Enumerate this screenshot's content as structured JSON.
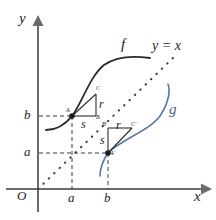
{
  "figure": {
    "kind": "math-diagram",
    "colors": {
      "axis": "#6b6b6b",
      "curve_f": "#2b2b2b",
      "curve_g": "#5577a8",
      "dashed": "#3a3a3a",
      "dotted": "#3a3a3a",
      "text": "#1c1c1c"
    }
  },
  "axes": {
    "y_label": "y",
    "x_label": "x",
    "origin_label": "O",
    "y_ticks": [
      {
        "label": "b",
        "value": "b"
      },
      {
        "label": "a",
        "value": "a"
      }
    ],
    "x_ticks": [
      {
        "label": "a",
        "value": "a"
      },
      {
        "label": "b",
        "value": "b"
      }
    ]
  },
  "curves": [
    {
      "name": "f",
      "label": "f",
      "color": "#2b2b2b"
    },
    {
      "name": "g",
      "label": "g",
      "color": "#5577a8"
    },
    {
      "name": "identity",
      "label": "y = x",
      "color": "#3a3a3a"
    }
  ],
  "upper_triangle": {
    "point_a": "A",
    "point_b": "B",
    "point_c": "C",
    "rise_label": "r",
    "run_label": "s"
  },
  "lower_triangle": {
    "point_a": "A'",
    "point_b": "B'",
    "point_c": "C'",
    "rise_label": "r",
    "run_label": "s"
  }
}
